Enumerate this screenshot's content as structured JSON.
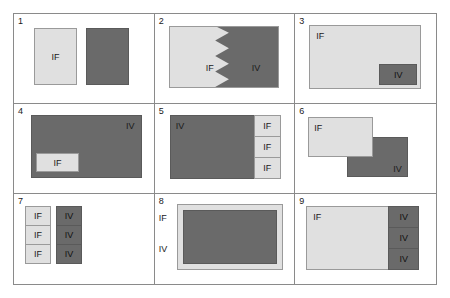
{
  "figure": {
    "label_if": "IF",
    "label_iv": "IV",
    "colors": {
      "light_fill": "#e0e0e0",
      "dark_fill": "#6a6a6a",
      "border": "#8a8a8a",
      "text": "#1a1a1a"
    },
    "panels": [
      {
        "number": "1",
        "shapes": [
          {
            "role": "light-rect",
            "label": "IF"
          },
          {
            "role": "dark-rect",
            "label": ""
          }
        ]
      },
      {
        "number": "2",
        "shapes": [
          {
            "role": "light-region-zigzag",
            "label": "IF"
          },
          {
            "role": "dark-region-zigzag",
            "label": "IV"
          }
        ]
      },
      {
        "number": "3",
        "shapes": [
          {
            "role": "light-rect",
            "label": "IF"
          },
          {
            "role": "dark-inset-bottom-right",
            "label": "IV"
          }
        ]
      },
      {
        "number": "4",
        "shapes": [
          {
            "role": "dark-rect",
            "label": "IV"
          },
          {
            "role": "light-inset-bottom-left",
            "label": "IF"
          }
        ]
      },
      {
        "number": "5",
        "shapes": [
          {
            "role": "dark-rect",
            "label": "IV"
          },
          {
            "role": "light-strip-1",
            "label": "IF"
          },
          {
            "role": "light-strip-2",
            "label": "IF"
          },
          {
            "role": "light-strip-3",
            "label": "IF"
          }
        ]
      },
      {
        "number": "6",
        "shapes": [
          {
            "role": "dark-rect-offset",
            "label": "IV"
          },
          {
            "role": "light-rect-offset",
            "label": "IF"
          }
        ]
      },
      {
        "number": "7",
        "shapes": [
          {
            "role": "light-stack-1",
            "label": "IF"
          },
          {
            "role": "light-stack-2",
            "label": "IF"
          },
          {
            "role": "light-stack-3",
            "label": "IF"
          },
          {
            "role": "dark-stack-1",
            "label": "IV"
          },
          {
            "role": "dark-stack-2",
            "label": "IV"
          },
          {
            "role": "dark-stack-3",
            "label": "IV"
          }
        ]
      },
      {
        "number": "8",
        "shapes": [
          {
            "role": "outside-label-top",
            "label": "IF"
          },
          {
            "role": "outside-label-bottom",
            "label": "IV"
          },
          {
            "role": "light-frame-dark-core",
            "label": ""
          }
        ]
      },
      {
        "number": "9",
        "shapes": [
          {
            "role": "light-rect",
            "label": "IF"
          },
          {
            "role": "dark-strip-1",
            "label": "IV"
          },
          {
            "role": "dark-strip-2",
            "label": "IV"
          },
          {
            "role": "dark-strip-3",
            "label": "IV"
          }
        ]
      }
    ]
  }
}
